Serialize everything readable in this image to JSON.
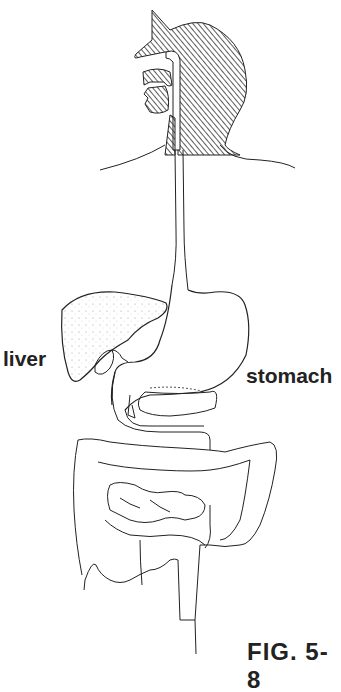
{
  "diagram": {
    "labels": {
      "liver": "liver",
      "stomach": "stomach",
      "figure": "FIG. 5-8"
    },
    "colors": {
      "line": "#222222",
      "hatch": "#333333",
      "background": "#ffffff"
    }
  }
}
